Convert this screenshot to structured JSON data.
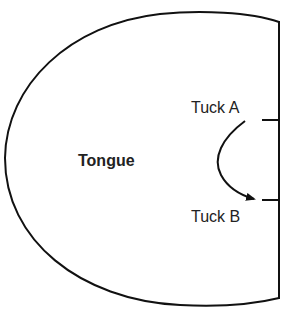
{
  "diagram": {
    "region_label": "Tongue",
    "tucks": [
      {
        "label": "Tuck A"
      },
      {
        "label": "Tuck B"
      }
    ],
    "colors": {
      "stroke": "#111111",
      "text": "#222222",
      "background": "#ffffff"
    }
  }
}
